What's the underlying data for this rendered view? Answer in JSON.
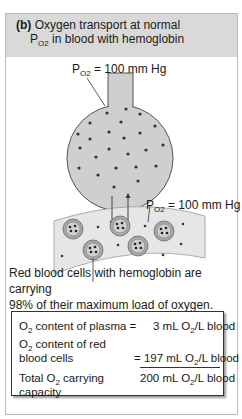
{
  "header": {
    "part": "(b)",
    "line1": "Oxygen transport at normal",
    "line2_prefix": "P",
    "line2_sub": "O2",
    "line2_rest": "in blood with hemoglobin"
  },
  "labels": {
    "alveolus_po2": {
      "p": "P",
      "sub": "O2",
      "value": "= 100 mm Hg"
    },
    "blood_po2": {
      "p": "P",
      "sub": "O2",
      "value": "= 100 mm Hg"
    }
  },
  "caption": {
    "line1": "Red blood cells with hemoglobin are carrying",
    "line2": "98% of their maximum load of oxygen."
  },
  "summary": {
    "plasma_label": "content of plasma =",
    "plasma_value": "3 mL",
    "plasma_unit": "/L blood",
    "rbc_label_1": "content of red",
    "rbc_label_2": "blood cells",
    "rbc_value": "= 197 mL",
    "rbc_unit": "/L blood",
    "total_label_1a": "Total",
    "total_label_1b": "carrying",
    "total_label_2": "capacity",
    "total_value": "200 mL",
    "total_unit": "/L blood",
    "o2_symbol": "O",
    "o2_sub": "2"
  },
  "colors": {
    "header_bg": "#d9d9d9",
    "alveolus_fill": "#cfcfcf",
    "vessel_fill": "#e6e6e6",
    "rbc_fill": "#a8a8a8",
    "dot": "#333333"
  }
}
